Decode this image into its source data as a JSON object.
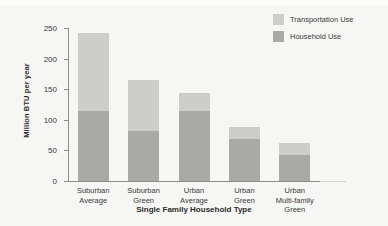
{
  "chart_data": {
    "type": "bar",
    "subtype": "stacked",
    "title": "",
    "xlabel": "Single Family Household Type",
    "ylabel": "Million BTU per year",
    "categories": [
      "Suburban Average",
      "Suburban Green",
      "Urban Average",
      "Urban Green",
      "Urban Multi-family Green"
    ],
    "category_lines": [
      "Suburban\nAverage",
      "Suburban\nGreen",
      "Urban\nAverage",
      "Urban\nGreen",
      "Urban\nMulti-family\nGreen"
    ],
    "series": [
      {
        "name": "Household Use",
        "color": "#a9a9a7",
        "values": [
          115,
          82,
          114,
          68,
          43
        ]
      },
      {
        "name": "Transportation Use",
        "color": "#cdcdcb",
        "values": [
          127,
          83,
          30,
          21,
          19
        ]
      }
    ],
    "totals": [
      242,
      165,
      144,
      89,
      62
    ],
    "ylim": [
      0,
      250
    ],
    "yticks": [
      0,
      50,
      100,
      150,
      200,
      250
    ],
    "ytick_labels": [
      "0",
      "50",
      "100",
      "150",
      "200",
      "250"
    ],
    "grid": false,
    "legend_position": "top-right",
    "legend_order": [
      "Transportation Use",
      "Household Use"
    ]
  },
  "legend": {
    "items": [
      {
        "label": "Transportation Use",
        "color": "#cdcdcb"
      },
      {
        "label": "Household Use",
        "color": "#a9a9a7"
      }
    ]
  },
  "colors": {
    "background": "#f6f6f4",
    "axis": "#8d8d8d",
    "text": "#3a3a3a",
    "transportation": "#cdcdcb",
    "household": "#a9a9a7"
  }
}
